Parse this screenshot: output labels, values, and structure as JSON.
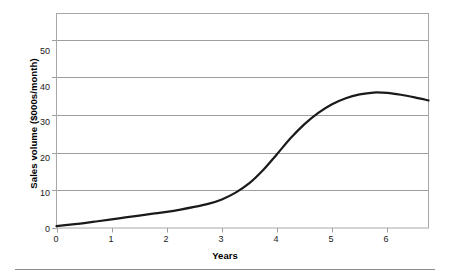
{
  "chart_data": {
    "type": "line",
    "title": "",
    "subtitle": "",
    "xlabel": "Years",
    "ylabel": "Sales volume ($000s/month)",
    "xlim": [
      0,
      6.75
    ],
    "ylim": [
      0,
      57
    ],
    "grid": true,
    "grid_axis": "y",
    "legend": false,
    "legend_position": "none",
    "xticks": [
      "0",
      "1",
      "2",
      "3",
      "4",
      "5",
      "6"
    ],
    "xtick_values": [
      0,
      1,
      2,
      3,
      4,
      5,
      6
    ],
    "yticks": [
      "0",
      "10",
      "20",
      "30",
      "40",
      "50"
    ],
    "ytick_values": [
      0,
      10,
      20,
      30,
      40,
      50
    ],
    "series": [
      {
        "name": "Sales volume",
        "color": "#1a1a1a",
        "line_width": 2.2,
        "x": [
          0.0,
          0.25,
          0.5,
          0.75,
          1.0,
          1.25,
          1.5,
          1.75,
          2.0,
          2.25,
          2.5,
          2.75,
          3.0,
          3.25,
          3.5,
          3.75,
          4.0,
          4.25,
          4.5,
          4.75,
          5.0,
          5.25,
          5.5,
          5.75,
          6.0,
          6.25,
          6.5,
          6.75
        ],
        "values": [
          0.5,
          0.9,
          1.3,
          1.8,
          2.3,
          2.8,
          3.3,
          3.8,
          4.3,
          4.9,
          5.6,
          6.4,
          7.6,
          9.4,
          11.9,
          15.4,
          19.6,
          23.9,
          27.6,
          30.6,
          32.9,
          34.5,
          35.5,
          36.0,
          35.9,
          35.4,
          34.7,
          33.9
        ]
      }
    ],
    "annotations": []
  },
  "axis": {
    "y_title": "Sales volume ($000s/month)",
    "x_title": "Years",
    "frame_color": "#a8a8a8",
    "grid_color": "#9e9e9e"
  },
  "figure": {
    "background": "#ffffff",
    "rule_color": "#8c8c8c"
  }
}
